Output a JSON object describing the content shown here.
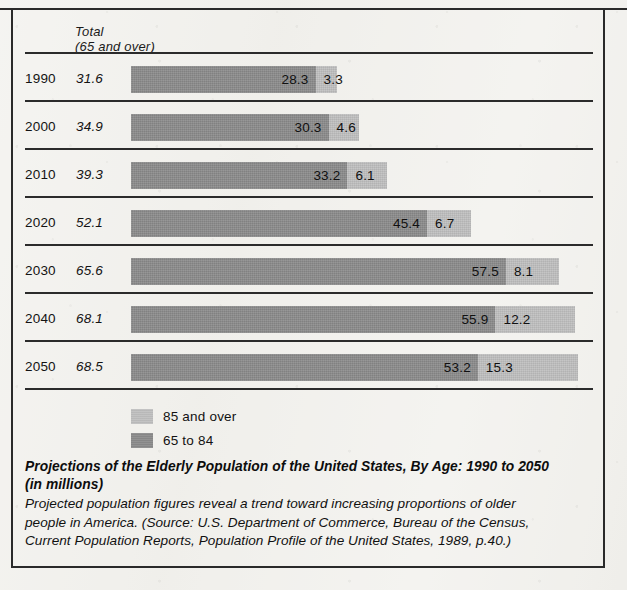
{
  "figure": {
    "column_header_line1": "Total",
    "column_header_line2": "(65 and over)",
    "caption_title_line1": "Projections of the Elderly Population of the United States, By Age: 1990 to 2050",
    "caption_title_line2": "(in millions)",
    "caption_body_line1": "Projected population figures reveal a trend toward increasing proportions of older",
    "caption_body_line2": "people in America. (Source: U.S. Department of Commerce, Bureau of the Census,",
    "caption_body_line3": "Current Population Reports, Population Profile of the United States, 1989, p.40.)"
  },
  "colors": {
    "bar_dark": "#8c8c8c",
    "bar_light": "#bfbfbf",
    "rule": "#2b2b2b",
    "paper": "#f1f0ec",
    "text": "#131313"
  },
  "legend": [
    {
      "label": "85 and over",
      "swatch": "light"
    },
    {
      "label": "65 to 84",
      "swatch": "dark"
    }
  ],
  "rows": [
    {
      "year": "1990",
      "total": "31.6",
      "dark": "28.3",
      "light": "3.3"
    },
    {
      "year": "2000",
      "total": "34.9",
      "dark": "30.3",
      "light": "4.6"
    },
    {
      "year": "2010",
      "total": "39.3",
      "dark": "33.2",
      "light": "6.1"
    },
    {
      "year": "2020",
      "total": "52.1",
      "dark": "45.4",
      "light": "6.7"
    },
    {
      "year": "2030",
      "total": "65.6",
      "dark": "57.5",
      "light": "8.1"
    },
    {
      "year": "2040",
      "total": "68.1",
      "dark": "55.9",
      "light": "12.2"
    },
    {
      "year": "2050",
      "total": "68.5",
      "dark": "53.2",
      "light": "15.3"
    }
  ],
  "chart_data": {
    "type": "bar",
    "title": "Projections of the Elderly Population of the United States, By Age: 1990 to 2050 (in millions)",
    "subtitle": "Total (65 and over)",
    "orientation": "horizontal",
    "stacked": true,
    "xlabel": "Population (millions)",
    "ylabel": "Year",
    "categories": [
      "1990",
      "2000",
      "2010",
      "2020",
      "2030",
      "2040",
      "2050"
    ],
    "series": [
      {
        "name": "65 to 84",
        "color": "#8c8c8c",
        "values": [
          28.3,
          30.3,
          33.2,
          45.4,
          57.5,
          55.9,
          53.2
        ]
      },
      {
        "name": "85 and over",
        "color": "#bfbfbf",
        "values": [
          3.3,
          4.6,
          6.1,
          6.7,
          8.1,
          12.2,
          15.3
        ]
      }
    ],
    "totals": [
      31.6,
      34.9,
      39.3,
      52.1,
      65.6,
      68.1,
      68.5
    ],
    "totals_label": "Total (65 and over)",
    "xlim": [
      0,
      70
    ],
    "grid": false,
    "legend_position": "bottom-left",
    "units": "millions",
    "source": "U.S. Department of Commerce, Bureau of the Census, Current Population Reports, Population Profile of the United States, 1989, p.40."
  },
  "scale": {
    "origin_px": 131,
    "px_per_unit": 6.52
  }
}
